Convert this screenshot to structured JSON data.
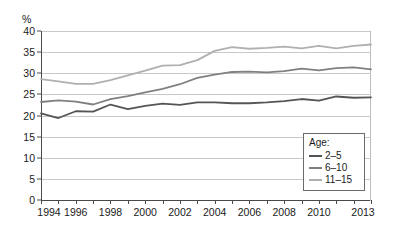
{
  "chart_data": {
    "type": "line",
    "title": "",
    "subtitle": "",
    "xlabel": "",
    "ylabel": "%",
    "ylim": [
      0,
      40
    ],
    "xlim": [
      1994,
      2013
    ],
    "ytick_step": 5,
    "grid": true,
    "legend_position": "lower-right",
    "legend_title": "Age:",
    "x": [
      1994,
      1995,
      1996,
      1997,
      1998,
      1999,
      2000,
      2001,
      2002,
      2003,
      2004,
      2005,
      2006,
      2007,
      2008,
      2009,
      2010,
      2011,
      2012,
      2013
    ],
    "ytick_labels": [
      "0",
      "5",
      "10",
      "15",
      "20",
      "25",
      "30",
      "35",
      "40"
    ],
    "xtick_labels": [
      "1994",
      "1996",
      "1998",
      "2000",
      "2002",
      "2004",
      "2006",
      "2008",
      "2010",
      "2013"
    ],
    "xtick_label_years": [
      1994,
      1996,
      1998,
      2000,
      2002,
      2004,
      2006,
      2008,
      2010,
      2013
    ],
    "series": [
      {
        "name": "2–5",
        "color": "#555555",
        "values": [
          20.5,
          19.4,
          21.0,
          20.9,
          22.6,
          21.5,
          22.3,
          22.8,
          22.5,
          23.1,
          23.1,
          22.9,
          22.9,
          23.1,
          23.4,
          23.9,
          23.5,
          24.5,
          24.2,
          24.3
        ]
      },
      {
        "name": "6–10",
        "color": "#808080",
        "values": [
          23.2,
          23.6,
          23.3,
          22.6,
          23.9,
          24.6,
          25.5,
          26.3,
          27.4,
          28.9,
          29.7,
          30.3,
          30.4,
          30.2,
          30.5,
          31.1,
          30.7,
          31.2,
          31.4,
          30.9
        ]
      },
      {
        "name": "11–15",
        "color": "#b0b0b0",
        "values": [
          28.6,
          28.1,
          27.5,
          27.5,
          28.4,
          29.5,
          30.6,
          31.8,
          31.9,
          33.1,
          35.3,
          36.2,
          35.8,
          36.0,
          36.3,
          35.9,
          36.5,
          35.9,
          36.5,
          36.8
        ]
      }
    ],
    "axis_unit_label": "%"
  },
  "ghost_text": ""
}
